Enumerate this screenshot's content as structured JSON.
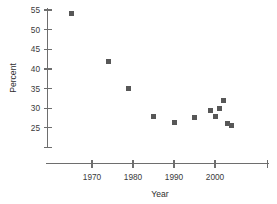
{
  "chart_data": {
    "type": "scatter",
    "title": "",
    "xlabel": "Year",
    "ylabel": "Percent",
    "xlim": [
      1962,
      2010
    ],
    "ylim": [
      21,
      56.5
    ],
    "xticks": [
      1970,
      1980,
      1990,
      2000
    ],
    "xtick_labels": [
      "1970",
      "1980",
      "1990",
      "2000"
    ],
    "yticks": [
      25,
      30,
      35,
      40,
      45,
      50,
      55
    ],
    "ytick_labels": [
      "25",
      "30",
      "35",
      "40",
      "45",
      "50",
      "55"
    ],
    "grid": false,
    "legend": "none",
    "marker": "square",
    "marker_color": "#575757",
    "axis_color": "#6e6e6e",
    "series": [
      {
        "name": "Percent",
        "points": [
          {
            "x": 1965,
            "y": 54.0
          },
          {
            "x": 1974,
            "y": 42.0
          },
          {
            "x": 1979,
            "y": 35.0
          },
          {
            "x": 1985,
            "y": 27.8
          },
          {
            "x": 1990,
            "y": 26.4
          },
          {
            "x": 1995,
            "y": 27.6
          },
          {
            "x": 1999,
            "y": 29.5
          },
          {
            "x": 2000,
            "y": 27.8
          },
          {
            "x": 2001,
            "y": 30.0
          },
          {
            "x": 2002,
            "y": 32.0
          },
          {
            "x": 2003,
            "y": 26.0
          },
          {
            "x": 2004,
            "y": 25.6
          }
        ]
      }
    ]
  }
}
